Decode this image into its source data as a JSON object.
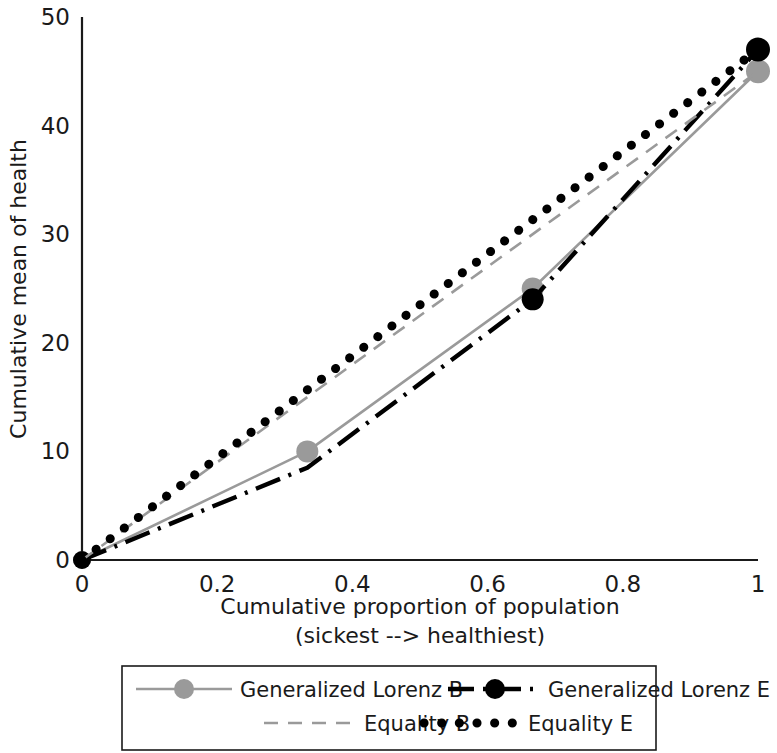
{
  "chart_data": {
    "type": "line",
    "title": "",
    "xlabel": "Cumulative proportion of population",
    "xlabel_line2": "(sickest --> healthiest)",
    "ylabel": "Cumulative mean of health",
    "xlim": [
      0,
      1
    ],
    "ylim": [
      0,
      50
    ],
    "xticks": [
      "0",
      "0.2",
      "0.4",
      "0.6",
      "0.8",
      "1"
    ],
    "xtick_values": [
      0,
      0.2,
      0.4,
      0.6,
      0.8,
      1
    ],
    "yticks": [
      "0",
      "10",
      "20",
      "30",
      "40",
      "50"
    ],
    "ytick_values": [
      0,
      10,
      20,
      30,
      40,
      50
    ],
    "grid": false,
    "legend_position": "bottom",
    "series": [
      {
        "name": "Generalized Lorenz B",
        "style": "solid",
        "color": "#9a9a9a",
        "marker": "circle",
        "marker_color": "#9a9a9a",
        "x": [
          0,
          0.3333,
          0.6667,
          1
        ],
        "values": [
          0,
          10,
          25,
          45
        ]
      },
      {
        "name": "Generalized Lorenz E",
        "style": "dash-dot",
        "color": "#000000",
        "marker": "circle",
        "marker_color": "#000000",
        "x": [
          0,
          0.3333,
          0.6667,
          1
        ],
        "values": [
          0,
          8.5,
          24,
          47
        ]
      },
      {
        "name": "Equality B",
        "style": "dashed",
        "color": "#9a9a9a",
        "marker": "none",
        "marker_color": "#9a9a9a",
        "x": [
          0,
          1
        ],
        "values": [
          0,
          45
        ]
      },
      {
        "name": "Equality E",
        "style": "dotted",
        "color": "#000000",
        "marker": "none",
        "marker_color": "#000000",
        "x": [
          0,
          1
        ],
        "values": [
          0,
          47
        ]
      }
    ]
  },
  "legend": {
    "entries": [
      {
        "label": "Generalized Lorenz B"
      },
      {
        "label": "Generalized Lorenz E"
      },
      {
        "label": "Equality B"
      },
      {
        "label": "Equality E"
      }
    ]
  },
  "colors": {
    "gray_series": "#9a9a9a",
    "black_series": "#000000",
    "axis": "#1a1a1a",
    "text": "#1a1a1a",
    "background": "#ffffff"
  }
}
